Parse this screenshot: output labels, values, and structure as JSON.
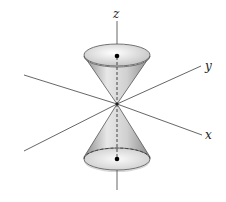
{
  "diagram": {
    "axes": {
      "z": "z",
      "y": "y",
      "x": "x"
    },
    "colors": {
      "axis": "#444444",
      "cone_light": "#f2f2f2",
      "cone_dark": "#9a9a9a",
      "point": "#000000"
    }
  }
}
